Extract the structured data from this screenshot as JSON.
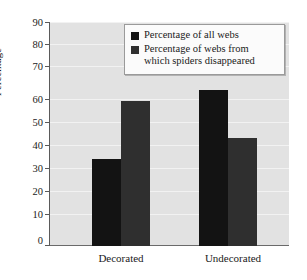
{
  "chart_data": {
    "type": "bar",
    "title": "",
    "subtitle": "",
    "xlabel": "",
    "ylabel": "Percentage",
    "categories": [
      "Decorated",
      "Undecorated"
    ],
    "series": [
      {
        "name": "Percentage of all webs",
        "color": "#131313",
        "values": [
          35,
          63
        ]
      },
      {
        "name": "Percentage of webs from\nwhich spiders disappeared",
        "color": "#2f2f2f",
        "values": [
          58.5,
          43.5
        ]
      }
    ],
    "ylim": [
      0,
      90
    ],
    "yticks": [
      0,
      10,
      20,
      30,
      40,
      50,
      60,
      70,
      80,
      90
    ],
    "ytick_labels": [
      "0",
      "10",
      "20",
      "30",
      "40",
      "50",
      "60",
      "70",
      "80",
      "90"
    ],
    "grid": true,
    "grid_axis": "y",
    "legend_position": "top-right",
    "plot_background": "#e2e2e2",
    "figure_background": "#ffffff",
    "annotations": []
  },
  "legend": {
    "entries": [
      {
        "label": "Percentage of all webs"
      },
      {
        "label": "Percentage of webs from\nwhich spiders disappeared"
      }
    ]
  },
  "axes": {
    "y_title": "Percentage",
    "tick_labels": [
      "90",
      "80",
      "70",
      "60",
      "50",
      "40",
      "30",
      "20",
      "10",
      "0"
    ],
    "category_labels": [
      "Decorated",
      "Undecorated"
    ]
  }
}
